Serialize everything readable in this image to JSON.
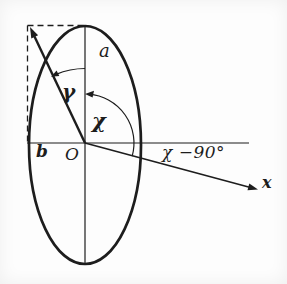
{
  "figure": {
    "colors": {
      "ink": "#1d1d1d",
      "paper": "#fdfdfd"
    },
    "labels": {
      "semi_major_axis": "a",
      "semi_minor_axis": "b",
      "origin": "O",
      "angle_gamma": "γ",
      "angle_chi": "χ",
      "angle_chi_minus_90": "χ −90°",
      "x_axis": "x"
    }
  }
}
